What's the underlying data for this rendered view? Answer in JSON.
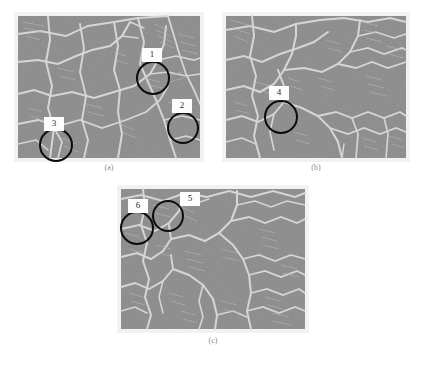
{
  "figure": {
    "background_color": "#ffffff",
    "panels": [
      {
        "id": "a",
        "caption": "(a)",
        "frame": {
          "x": 14,
          "y": 12,
          "w": 190,
          "h": 150
        },
        "caption_y": 163,
        "markers": [
          {
            "label": "1",
            "circle": {
              "cx": 153,
              "cy": 78,
              "r": 17
            },
            "label_box": {
              "x": 142,
              "y": 48,
              "w": 20,
              "h": 14
            }
          },
          {
            "label": "2",
            "circle": {
              "cx": 183,
              "cy": 128,
              "r": 16
            },
            "label_box": {
              "x": 172,
              "y": 99,
              "w": 20,
              "h": 14
            }
          },
          {
            "label": "3",
            "circle": {
              "cx": 56,
              "cy": 145,
              "r": 17
            },
            "label_box": {
              "x": 44,
              "y": 117,
              "w": 20,
              "h": 14
            }
          }
        ]
      },
      {
        "id": "b",
        "caption": "(b)",
        "frame": {
          "x": 222,
          "y": 12,
          "w": 188,
          "h": 150
        },
        "caption_y": 163,
        "markers": [
          {
            "label": "4",
            "circle": {
              "cx": 281,
              "cy": 117,
              "r": 17
            },
            "label_box": {
              "x": 269,
              "y": 86,
              "w": 20,
              "h": 14
            }
          }
        ]
      },
      {
        "id": "c",
        "caption": "(c)",
        "frame": {
          "x": 117,
          "y": 185,
          "w": 192,
          "h": 148
        },
        "caption_y": 336,
        "markers": [
          {
            "label": "6",
            "circle": {
              "cx": 137,
              "cy": 228,
              "r": 17
            },
            "label_box": {
              "x": 128,
              "y": 199,
              "w": 20,
              "h": 14
            }
          },
          {
            "label": "5",
            "circle": {
              "cx": 168,
              "cy": 216,
              "r": 16
            },
            "label_box": {
              "x": 180,
              "y": 192,
              "w": 20,
              "h": 14
            }
          }
        ]
      }
    ],
    "micrograph_colors": {
      "grain_fill": "#8b8b8b",
      "grain_boundary": "#d5d5d3",
      "border": "#f2f2f0",
      "twin_line": "#b4b4b2",
      "circle_stroke": "#0d0d0d",
      "label_background": "#fdfdfb",
      "label_text": "#2a2a2a",
      "caption_text": "#8c8c8c"
    }
  }
}
